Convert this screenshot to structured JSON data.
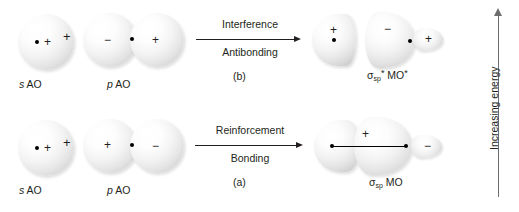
{
  "figure": {
    "energy_axis": {
      "label": "Increasing energy",
      "direction": "up",
      "arrow_icon": "up-arrow-icon"
    }
  },
  "rows": [
    {
      "id": "antibonding",
      "panel_letter": "(b)",
      "reactants": [
        {
          "name": "s-atomic-orbital",
          "caption_italic": "s",
          "caption_rest": " AO",
          "lobes": [
            {
              "sign": "+",
              "type": "sphere"
            }
          ]
        },
        {
          "name": "p-atomic-orbital",
          "caption_italic": "p",
          "caption_rest": " AO",
          "lobes": [
            {
              "sign": "−",
              "type": "sphere"
            },
            {
              "sign": "+",
              "type": "sphere"
            }
          ]
        }
      ],
      "operator": "+",
      "arrow": {
        "label_above": "Interference",
        "label_below": "Antibonding"
      },
      "product": {
        "name": "sigma-star-sp-antibonding-mo",
        "label_sigma": "σ",
        "label_sub": "sp",
        "label_sup": "*",
        "label_rest": " MO",
        "trailing_marker": "*",
        "lobes": [
          {
            "sign": "+",
            "type": "half-lobe"
          },
          {
            "sign": "−",
            "type": "half-lobe"
          },
          {
            "sign": "+",
            "type": "teardrop"
          }
        ]
      }
    },
    {
      "id": "bonding",
      "panel_letter": "(a)",
      "reactants": [
        {
          "name": "s-atomic-orbital",
          "caption_italic": "s",
          "caption_rest": " AO",
          "lobes": [
            {
              "sign": "+",
              "type": "sphere"
            }
          ]
        },
        {
          "name": "p-atomic-orbital",
          "caption_italic": "p",
          "caption_rest": " AO",
          "lobes": [
            {
              "sign": "+",
              "type": "sphere"
            },
            {
              "sign": "−",
              "type": "sphere"
            }
          ]
        }
      ],
      "operator": "+",
      "arrow": {
        "label_above": "Reinforcement",
        "label_below": "Bonding"
      },
      "product": {
        "name": "sigma-sp-bonding-mo",
        "label_sigma": "σ",
        "label_sub": "sp",
        "label_sup": "",
        "label_rest": " MO",
        "trailing_marker": "",
        "lobes": [
          {
            "sign": "+",
            "type": "merged-lobe"
          },
          {
            "sign": "−",
            "type": "teardrop"
          }
        ]
      }
    }
  ]
}
